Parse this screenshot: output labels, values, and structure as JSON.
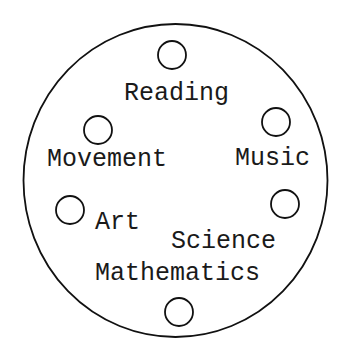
{
  "diagram": {
    "type": "circular-activity-diagram",
    "outer_circle": {
      "cx": 175.5,
      "cy": 180.5,
      "rx": 152,
      "ry": 156.5,
      "stroke": "#111111"
    },
    "nodes": [
      {
        "id": "reading",
        "label": "Reading",
        "marker": {
          "cx": 172,
          "cy": 55,
          "r": 14
        },
        "text": {
          "x": 124,
          "y": 100
        }
      },
      {
        "id": "music",
        "label": "Music",
        "marker": {
          "cx": 276,
          "cy": 122,
          "r": 14
        },
        "text": {
          "x": 235,
          "y": 165
        }
      },
      {
        "id": "movement",
        "label": "Movement",
        "marker": {
          "cx": 98,
          "cy": 130,
          "r": 14
        },
        "text": {
          "x": 47,
          "y": 166
        }
      },
      {
        "id": "art",
        "label": "Art",
        "marker": {
          "cx": 70,
          "cy": 210,
          "r": 14
        },
        "text": {
          "x": 95,
          "y": 229
        }
      },
      {
        "id": "science",
        "label": "Science",
        "marker": {
          "cx": 285,
          "cy": 204,
          "r": 14
        },
        "text": {
          "x": 171,
          "y": 248
        }
      },
      {
        "id": "mathematics",
        "label": "Mathematics",
        "marker": {
          "cx": 179,
          "cy": 312,
          "r": 14
        },
        "text": {
          "x": 95,
          "y": 280
        }
      }
    ]
  }
}
